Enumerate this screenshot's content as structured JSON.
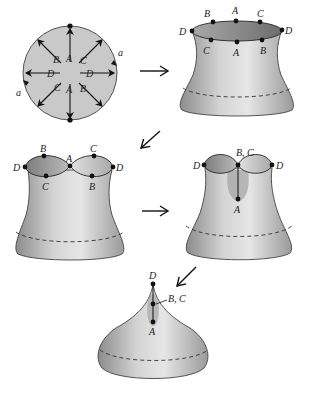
{
  "figure": {
    "colors": {
      "disk_fill": "#c9c9c9",
      "outline": "#333333",
      "dot": "#111111",
      "arrow": "#111111"
    },
    "disk": {
      "inner_labels": {
        "A_top": "A",
        "A_bottom": "A",
        "B_upper_left": "B",
        "B_lower_right": "B",
        "C_upper_right": "C",
        "C_lower_left": "C",
        "D_left": "D",
        "D_right": "D"
      },
      "edge_labels": {
        "a_right": "a",
        "a_left": "a"
      }
    },
    "step2": {
      "top_labels": [
        "B",
        "A",
        "C"
      ],
      "bottom_labels": [
        "C",
        "A",
        "B"
      ],
      "side_labels": [
        "D",
        "D"
      ]
    },
    "step3": {
      "labels": {
        "D_left": "D",
        "B_top": "B",
        "A_mid": "A",
        "C_top": "C",
        "D_right": "D",
        "C_bottom": "C",
        "B_bottom": "B"
      }
    },
    "step4": {
      "labels": {
        "D_left": "D",
        "BC": "B, C",
        "D_right": "D",
        "A": "A"
      }
    },
    "step5": {
      "labels": {
        "D": "D",
        "BC": "B, C",
        "A": "A"
      }
    },
    "arrows": [
      {
        "id": "arrow-1",
        "direction": "right"
      },
      {
        "id": "arrow-2",
        "direction": "down-left"
      },
      {
        "id": "arrow-3",
        "direction": "right"
      },
      {
        "id": "arrow-4",
        "direction": "down-left"
      }
    ]
  }
}
